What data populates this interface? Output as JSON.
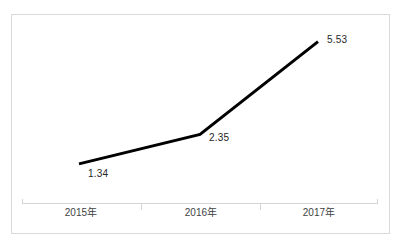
{
  "chart_data": {
    "type": "line",
    "title": "",
    "subtitle": "",
    "xlabel": "",
    "ylabel": "",
    "categories": [
      "2015年",
      "2016年",
      "2017年"
    ],
    "values": [
      1.34,
      2.35,
      5.53
    ],
    "point_labels": [
      "1.34",
      "2.35",
      "5.53"
    ],
    "series": [
      {
        "name": "",
        "values": [
          1.34,
          2.35,
          5.53
        ],
        "color": "#000000",
        "line_width": 3,
        "markers": false
      }
    ],
    "ylim": [
      0,
      6.2
    ],
    "grid": false,
    "legend": false,
    "legend_position": "none",
    "axis_line_color": "#d9d9d9",
    "plot_border_color": "#d9d9d9",
    "background_color": "#ffffff",
    "data_label_color": "#262626",
    "tick_label_color": "#3f3f3f",
    "annotations": []
  },
  "axis": {
    "ticks": [
      "tick-0",
      "tick-1"
    ],
    "line_name": "category-axis-line"
  }
}
